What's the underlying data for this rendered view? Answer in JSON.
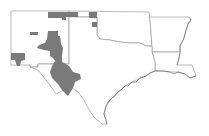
{
  "map": {
    "type": "species-distribution-map",
    "region": "South-central United States",
    "states": [
      "New Mexico",
      "Texas",
      "Oklahoma",
      "Arkansas",
      "Louisiana"
    ],
    "colors": {
      "background": "#ffffff",
      "state_fill": "#ffffff",
      "border": "#8c8c8c",
      "occurrence_fill": "#7a7a7a"
    },
    "occurrence_areas": [
      {
        "name": "northern-new-mexico-counties"
      },
      {
        "name": "oklahoma-panhandle-county"
      },
      {
        "name": "north-central-new-mexico"
      },
      {
        "name": "central-new-mexico-block"
      },
      {
        "name": "southwest-new-mexico"
      },
      {
        "name": "trans-pecos-texas"
      }
    ]
  }
}
